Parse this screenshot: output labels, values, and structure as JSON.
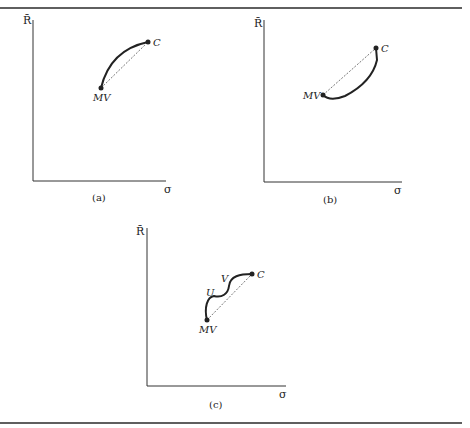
{
  "rules": {
    "color": "#2a2a2a"
  },
  "panels": [
    {
      "id": "a",
      "caption": "(a)",
      "y_axis_label": "R̄",
      "x_axis_label": "σ",
      "points": [
        {
          "label": "MV"
        },
        {
          "label": "C"
        }
      ],
      "curve_shape": "concave (bows up-left of chord)"
    },
    {
      "id": "b",
      "caption": "(b)",
      "y_axis_label": "R̄",
      "x_axis_label": "σ",
      "points": [
        {
          "label": "MV"
        },
        {
          "label": "C"
        }
      ],
      "curve_shape": "convex (bows down-right of chord)"
    },
    {
      "id": "c",
      "caption": "(c)",
      "y_axis_label": "R̄",
      "x_axis_label": "σ",
      "points": [
        {
          "label": "MV"
        },
        {
          "label": "C"
        }
      ],
      "inflection_labels": [
        "U",
        "V"
      ],
      "curve_shape": "wavy with inflection between U and V"
    }
  ]
}
